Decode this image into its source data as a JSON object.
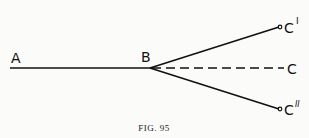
{
  "figure": {
    "caption": "FIG. 95",
    "points": {
      "A": "A",
      "B": "B",
      "C": "C",
      "C1": "C",
      "C1_mark": "I",
      "C2": "C",
      "C2_mark": "II"
    },
    "line_color": "#111111"
  }
}
